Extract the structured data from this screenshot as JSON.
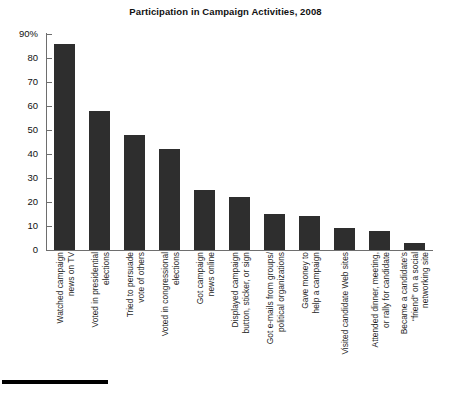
{
  "chart_data": {
    "type": "bar",
    "title": "Participation in Campaign Activities, 2008",
    "xlabel": "",
    "ylabel": "",
    "ylim": [
      0,
      90
    ],
    "ytick_labels": [
      "90%",
      "80",
      "70",
      "60",
      "50",
      "40",
      "30",
      "20",
      "10",
      "0"
    ],
    "ytick_values": [
      90,
      80,
      70,
      60,
      50,
      40,
      30,
      20,
      10,
      0
    ],
    "grid": false,
    "legend": "none",
    "bar_color": "#2e2e2e",
    "categories": [
      "Watched campaign news on TV",
      "Voted in presidential elections",
      "Tried to persuade vote of others",
      "Voted in congressional elections",
      "Got campaign news online",
      "Displayed campaign button, sticker, or sign",
      "Got e-mails from groups/ political organizations",
      "Gave money to help a campaign",
      "Visited candidate Web sites",
      "Attended dinner, meeting, or rally for candidate",
      "Became a candidate's “friend” on a social networking site"
    ],
    "category_lines": [
      [
        "Watched campaign",
        "news on TV"
      ],
      [
        "Voted in presidential",
        "elections"
      ],
      [
        "Tried to persuade",
        "vote of others"
      ],
      [
        "Voted in congressional",
        "elections"
      ],
      [
        "Got campaign",
        "news online"
      ],
      [
        "Displayed campaign",
        "button, sticker, or sign"
      ],
      [
        "Got e-mails from groups/",
        "political organizations"
      ],
      [
        "Gave money to",
        "help a campaign"
      ],
      [
        "Visited candidate Web sites"
      ],
      [
        "Attended dinner, meeting,",
        "or rally for candidate"
      ],
      [
        "Became a candidate’s",
        "“friend” on a social",
        "networking site"
      ]
    ],
    "values": [
      86,
      58,
      48,
      42,
      25,
      22,
      15,
      14,
      9,
      8,
      3
    ]
  }
}
